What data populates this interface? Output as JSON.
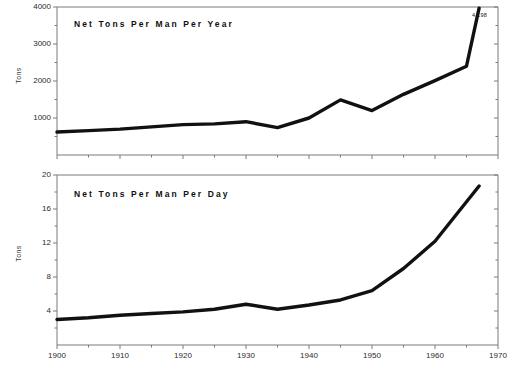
{
  "figure": {
    "background_color": "#ffffff",
    "line_color": "#111111",
    "axis_color": "#7a7a7a"
  },
  "panels": [
    {
      "id": "per-year",
      "title": "Net Tons Per Man Per Year",
      "ylabel": "Tons",
      "annotation": "4,198"
    },
    {
      "id": "per-day",
      "title": "Net Tons Per Man Per Day",
      "ylabel": "Tons",
      "annotation": ""
    }
  ],
  "x_tick_labels": [
    "1900",
    "1910",
    "1920",
    "1930",
    "1940",
    "1950",
    "1960",
    "1970"
  ],
  "y_tick_labels_top": [
    "4000",
    "3000",
    "2000",
    "1000"
  ],
  "y_tick_labels_bottom": [
    "20",
    "16",
    "12",
    "8",
    "4"
  ],
  "chart_data": [
    {
      "type": "line",
      "title": "Net Tons Per Man Per Year",
      "xlabel": "",
      "ylabel": "Tons",
      "xlim": [
        1900,
        1970
      ],
      "ylim": [
        0,
        4000
      ],
      "xticks": [
        1900,
        1910,
        1920,
        1930,
        1940,
        1950,
        1960,
        1970
      ],
      "yticks": [
        1000,
        2000,
        3000,
        4000
      ],
      "minor_xticks": [
        1905,
        1915,
        1925,
        1935,
        1945,
        1955,
        1965
      ],
      "minor_yticks": [
        500,
        1500,
        2500,
        3500
      ],
      "grid": false,
      "legend": "none",
      "annotations": [
        {
          "text": "4,198",
          "x": 1967,
          "y": 4198
        }
      ],
      "x": [
        1900,
        1905,
        1910,
        1915,
        1920,
        1925,
        1930,
        1935,
        1940,
        1945,
        1950,
        1955,
        1960,
        1965,
        1967
      ],
      "values": [
        620,
        660,
        700,
        760,
        820,
        840,
        900,
        740,
        1000,
        1490,
        1200,
        1640,
        2010,
        2400,
        3970
      ]
    },
    {
      "type": "line",
      "title": "Net Tons Per Man Per Day",
      "xlabel": "",
      "ylabel": "Tons",
      "xlim": [
        1900,
        1970
      ],
      "ylim": [
        0,
        20
      ],
      "xticks": [
        1900,
        1910,
        1920,
        1930,
        1940,
        1950,
        1960,
        1970
      ],
      "yticks": [
        4,
        8,
        12,
        16,
        20
      ],
      "minor_xticks": [
        1905,
        1915,
        1925,
        1935,
        1945,
        1955,
        1965
      ],
      "minor_yticks": [
        2,
        6,
        10,
        14,
        18
      ],
      "grid": false,
      "legend": "none",
      "annotations": [],
      "x": [
        1900,
        1905,
        1910,
        1915,
        1920,
        1925,
        1930,
        1935,
        1940,
        1945,
        1950,
        1955,
        1960,
        1967
      ],
      "values": [
        3.0,
        3.2,
        3.5,
        3.7,
        3.9,
        4.2,
        4.8,
        4.2,
        4.7,
        5.3,
        6.4,
        9.0,
        12.2,
        18.7
      ]
    }
  ]
}
